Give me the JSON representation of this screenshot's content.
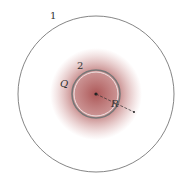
{
  "diagram": {
    "labels": {
      "outer_sphere": "1",
      "inner_sphere": "2",
      "charge": "Q",
      "radius": "R"
    },
    "colors": {
      "stroke": "#666666",
      "glow": "#9e3a3a",
      "background": "#ffffff"
    }
  }
}
